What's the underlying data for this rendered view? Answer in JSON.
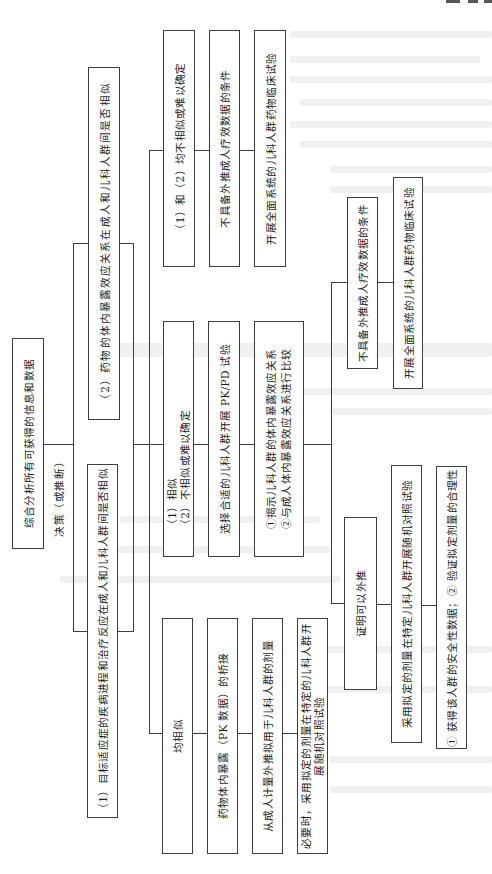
{
  "flowchart": {
    "root": "综合分析所有可获得的信息和数据",
    "decision_label": "决策（或推断）",
    "criteria": [
      "（1）目标适应症的疾病进程和治疗反应在成人和儿科人群间是否相似",
      "（2）药物的体内暴露效应关系在成人和儿科人群间是否相似"
    ],
    "branch_similar": {
      "condition": "均相似",
      "steps": [
        "药物体内暴露（PK 数据）的桥接",
        "从成人计量外推拟用于儿科人群的剂量"
      ],
      "final_lines": [
        "必要时，采用拟定的剂量在特定的儿科人群开",
        "展随机对照试验"
      ]
    },
    "branch_partial": {
      "condition_lines": [
        "（1）相似",
        "（2）不相似或难以确定"
      ],
      "study": "选择合适的儿科人群开展 PK/PD 试验",
      "analysis_lines": [
        "①揭示儿科人群的体内暴露效应关系",
        "②与成人体内暴露效应关系进行比较"
      ],
      "extrapolable": {
        "condition": "证明可以外推",
        "action": "采用拟定的剂量在特定儿科人群开展随机对照试验",
        "goals": "① 获得该人群的安全性数据；② 验证拟定剂量的合理性"
      },
      "not_extrapolable": {
        "condition": "不具备外推成人疗效数据的条件",
        "action": "开展全面系统的儿科人群药物临床试验"
      }
    },
    "branch_dissimilar": {
      "condition": "（1）和（2）均不相似或难以确定",
      "conclusion": "不具备外推成人疗效数据的条件",
      "action": "开展全面系统的儿科人群药物临床试验"
    }
  },
  "colors": {
    "line": "#3d3d3d",
    "text": "#1e1e1e",
    "paper": "#ffffff",
    "bleed": "#f0f0f0"
  }
}
